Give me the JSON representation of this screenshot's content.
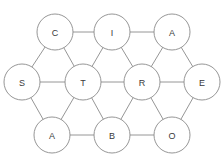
{
  "diagram": {
    "type": "node-link-graph",
    "canvas": {
      "width": 223,
      "height": 163,
      "background": "#ffffff"
    },
    "style": {
      "node_fill": "#ffffff",
      "node_stroke": "#8a8a8a",
      "edge_stroke": "#8a8a8a",
      "label_color": "#3a3a3a",
      "node_radius": 18,
      "stroke_width": 0.9,
      "label_font_size": 9
    },
    "nodes": [
      {
        "id": "C",
        "label": "C",
        "cx": 55,
        "cy": 32,
        "row": "top"
      },
      {
        "id": "I",
        "label": "I",
        "cx": 112,
        "cy": 32,
        "row": "top"
      },
      {
        "id": "A1",
        "label": "A",
        "cx": 172,
        "cy": 32,
        "row": "top"
      },
      {
        "id": "S",
        "label": "S",
        "cx": 22,
        "cy": 82,
        "row": "middle"
      },
      {
        "id": "T",
        "label": "T",
        "cx": 83,
        "cy": 82,
        "row": "middle"
      },
      {
        "id": "R",
        "label": "R",
        "cx": 142,
        "cy": 82,
        "row": "middle"
      },
      {
        "id": "E",
        "label": "E",
        "cx": 202,
        "cy": 82,
        "row": "middle"
      },
      {
        "id": "A2",
        "label": "A",
        "cx": 52,
        "cy": 135,
        "row": "bottom"
      },
      {
        "id": "B",
        "label": "B",
        "cx": 112,
        "cy": 135,
        "row": "bottom"
      },
      {
        "id": "O",
        "label": "O",
        "cx": 172,
        "cy": 135,
        "row": "bottom"
      }
    ],
    "edges": [
      {
        "source": "C",
        "target": "I"
      },
      {
        "source": "I",
        "target": "A1"
      },
      {
        "source": "C",
        "target": "S"
      },
      {
        "source": "C",
        "target": "T"
      },
      {
        "source": "I",
        "target": "T"
      },
      {
        "source": "I",
        "target": "R"
      },
      {
        "source": "A1",
        "target": "R"
      },
      {
        "source": "A1",
        "target": "E"
      },
      {
        "source": "S",
        "target": "T"
      },
      {
        "source": "T",
        "target": "R"
      },
      {
        "source": "R",
        "target": "E"
      },
      {
        "source": "S",
        "target": "A2"
      },
      {
        "source": "T",
        "target": "A2"
      },
      {
        "source": "T",
        "target": "B"
      },
      {
        "source": "R",
        "target": "B"
      },
      {
        "source": "R",
        "target": "O"
      },
      {
        "source": "E",
        "target": "O"
      },
      {
        "source": "A2",
        "target": "B"
      },
      {
        "source": "B",
        "target": "O"
      }
    ]
  }
}
